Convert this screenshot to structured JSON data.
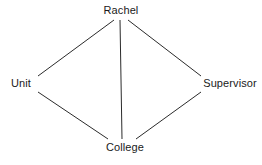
{
  "diagram": {
    "type": "node-link-graph",
    "background_color": "#ffffff",
    "edge_color": "#2b2b2b",
    "text_color": "#1a1a1a",
    "nodes": [
      {
        "id": "rachel",
        "label": "Rachel",
        "x": 121,
        "y": 11
      },
      {
        "id": "unit",
        "label": "Unit",
        "x": 21,
        "y": 84
      },
      {
        "id": "supervisor",
        "label": "Supervisor",
        "x": 230,
        "y": 84
      },
      {
        "id": "college",
        "label": "College",
        "x": 125,
        "y": 148
      }
    ],
    "edges": [
      {
        "from": "rachel",
        "to": "unit",
        "x1": 114,
        "y1": 20,
        "x2": 38,
        "y2": 76
      },
      {
        "from": "rachel",
        "to": "supervisor",
        "x1": 128,
        "y1": 20,
        "x2": 201,
        "y2": 76
      },
      {
        "from": "rachel",
        "to": "college",
        "x1": 120,
        "y1": 20,
        "x2": 122,
        "y2": 139
      },
      {
        "from": "unit",
        "to": "college",
        "x1": 38,
        "y1": 92,
        "x2": 108,
        "y2": 139
      },
      {
        "from": "supervisor",
        "to": "college",
        "x1": 201,
        "y1": 92,
        "x2": 136,
        "y2": 139
      }
    ]
  }
}
